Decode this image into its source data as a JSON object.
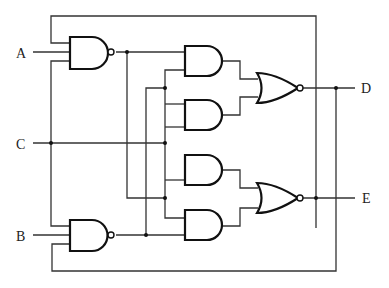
{
  "diagram": {
    "type": "logic-circuit",
    "inputs": [
      {
        "label": "A"
      },
      {
        "label": "C"
      },
      {
        "label": "B"
      }
    ],
    "outputs": [
      {
        "label": "D"
      },
      {
        "label": "E"
      }
    ],
    "gates": [
      {
        "id": "G1",
        "type": "NAND",
        "inputs": [
          "feedback-D",
          "A",
          "C"
        ]
      },
      {
        "id": "G2",
        "type": "NAND",
        "inputs": [
          "C",
          "B",
          "feedback-E"
        ]
      },
      {
        "id": "G3",
        "type": "AND",
        "inputs": [
          "G1",
          "C"
        ]
      },
      {
        "id": "G4",
        "type": "AND",
        "inputs": [
          "C",
          "C"
        ]
      },
      {
        "id": "G5",
        "type": "AND",
        "inputs": [
          "C",
          "G1"
        ]
      },
      {
        "id": "G6",
        "type": "AND",
        "inputs": [
          "G1",
          "G2"
        ]
      },
      {
        "id": "G7",
        "type": "NOR",
        "inputs": [
          "G3",
          "G4"
        ],
        "output": "D"
      },
      {
        "id": "G8",
        "type": "NOR",
        "inputs": [
          "G5",
          "G6"
        ],
        "output": "E"
      }
    ]
  }
}
